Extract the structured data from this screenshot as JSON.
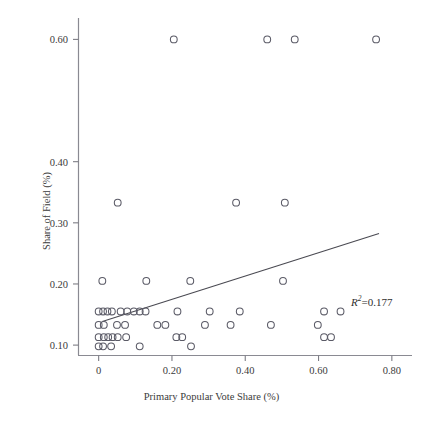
{
  "chart_data": {
    "type": "scatter",
    "title": "",
    "xlabel": "Primary Popular Vote Share (%)",
    "ylabel": "Share of Field (%)",
    "xlim": [
      -0.055,
      0.855
    ],
    "ylim": [
      0.083,
      0.635
    ],
    "grid": false,
    "legend": null,
    "xticks": [
      0,
      0.2,
      0.4,
      0.6,
      0.8
    ],
    "xtick_labels": [
      "0",
      "0.20",
      "0.40",
      "0.60",
      "0.80"
    ],
    "yticks": [
      0.1,
      0.2,
      0.3,
      0.4,
      0.6
    ],
    "ytick_labels": [
      "0.10",
      "0.20",
      "0.30",
      "0.40",
      "0.60"
    ],
    "marker": "open-circle",
    "marker_color": "#5a5a66",
    "marker_radius": 3.4,
    "annotations": [
      {
        "name": "r-squared",
        "text": "R2=0.177",
        "r_symbol": "R",
        "superscript": "2",
        "value_text": "=0.177",
        "value": 0.177,
        "x": 0.695,
        "y": 0.1465
      }
    ],
    "fit_line": {
      "name": "ols-regression-line",
      "color": "#4a4a52",
      "width": 1.1,
      "x_start": 0.01,
      "y_start": 0.1385,
      "x_end": 0.765,
      "y_end": 0.2825,
      "slope": 0.1907,
      "intercept": 0.1366
    },
    "points": [
      {
        "x": 0.205,
        "y": 0.6
      },
      {
        "x": 0.46,
        "y": 0.6
      },
      {
        "x": 0.535,
        "y": 0.6
      },
      {
        "x": 0.757,
        "y": 0.6
      },
      {
        "x": 0.052,
        "y": 0.333
      },
      {
        "x": 0.375,
        "y": 0.333
      },
      {
        "x": 0.508,
        "y": 0.333
      },
      {
        "x": 0.01,
        "y": 0.205
      },
      {
        "x": 0.13,
        "y": 0.205
      },
      {
        "x": 0.25,
        "y": 0.205
      },
      {
        "x": 0.0,
        "y": 0.155
      },
      {
        "x": 0.012,
        "y": 0.155
      },
      {
        "x": 0.024,
        "y": 0.155
      },
      {
        "x": 0.036,
        "y": 0.155
      },
      {
        "x": 0.06,
        "y": 0.155
      },
      {
        "x": 0.078,
        "y": 0.155
      },
      {
        "x": 0.096,
        "y": 0.155
      },
      {
        "x": 0.112,
        "y": 0.155
      },
      {
        "x": 0.128,
        "y": 0.155
      },
      {
        "x": 0.215,
        "y": 0.155
      },
      {
        "x": 0.303,
        "y": 0.155
      },
      {
        "x": 0.385,
        "y": 0.155
      },
      {
        "x": 0.503,
        "y": 0.205
      },
      {
        "x": 0.615,
        "y": 0.155
      },
      {
        "x": 0.66,
        "y": 0.155
      },
      {
        "x": 0.0,
        "y": 0.133
      },
      {
        "x": 0.014,
        "y": 0.133
      },
      {
        "x": 0.05,
        "y": 0.133
      },
      {
        "x": 0.072,
        "y": 0.133
      },
      {
        "x": 0.16,
        "y": 0.133
      },
      {
        "x": 0.182,
        "y": 0.133
      },
      {
        "x": 0.29,
        "y": 0.133
      },
      {
        "x": 0.36,
        "y": 0.133
      },
      {
        "x": 0.47,
        "y": 0.133
      },
      {
        "x": 0.598,
        "y": 0.133
      },
      {
        "x": 0.0,
        "y": 0.113
      },
      {
        "x": 0.014,
        "y": 0.113
      },
      {
        "x": 0.026,
        "y": 0.113
      },
      {
        "x": 0.038,
        "y": 0.113
      },
      {
        "x": 0.052,
        "y": 0.113
      },
      {
        "x": 0.075,
        "y": 0.113
      },
      {
        "x": 0.212,
        "y": 0.113
      },
      {
        "x": 0.228,
        "y": 0.113
      },
      {
        "x": 0.615,
        "y": 0.113
      },
      {
        "x": 0.634,
        "y": 0.113
      },
      {
        "x": 0.0,
        "y": 0.098
      },
      {
        "x": 0.012,
        "y": 0.098
      },
      {
        "x": 0.034,
        "y": 0.098
      },
      {
        "x": 0.112,
        "y": 0.098
      },
      {
        "x": 0.252,
        "y": 0.098
      }
    ]
  },
  "axes": {
    "frame_color": "#7d7d85",
    "tick_color": "#7d7d85"
  }
}
